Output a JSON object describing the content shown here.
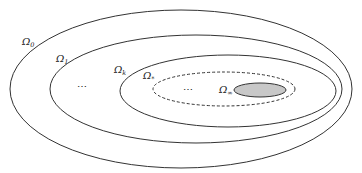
{
  "diagram": {
    "type": "nested-sets",
    "sets": [
      {
        "id": "omega-0",
        "symbol": "Ω",
        "subscript": "0",
        "style": "solid"
      },
      {
        "id": "omega-1",
        "symbol": "Ω",
        "subscript": "1",
        "style": "solid"
      },
      {
        "id": "omega-k",
        "symbol": "Ω",
        "subscript": "k",
        "style": "solid"
      },
      {
        "id": "omega-star",
        "symbol": "Ω",
        "subscript": "*",
        "style": "dashed"
      },
      {
        "id": "omega-inf",
        "symbol": "Ω",
        "subscript": "∞",
        "style": "filled"
      }
    ],
    "ellipsis_1": "⋯",
    "ellipsis_2": "⋯",
    "colors": {
      "stroke": "#333333",
      "fill_inner": "#c8c8c8",
      "background": "#ffffff"
    }
  }
}
